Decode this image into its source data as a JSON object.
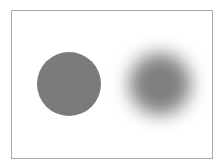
{
  "diagram": {
    "frame": {
      "border_color": "#a8a8a8",
      "background": "#ffffff"
    },
    "shapes": [
      {
        "name": "sharp-circle",
        "type": "circle",
        "edge": "sharp",
        "fill": "#7b7b7b",
        "center": [
          67,
          83
        ],
        "radius": 32
      },
      {
        "name": "blurred-circle",
        "type": "circle",
        "edge": "blurred",
        "fill": "#808080",
        "center": [
          159,
          83
        ],
        "radius": 31
      }
    ]
  }
}
